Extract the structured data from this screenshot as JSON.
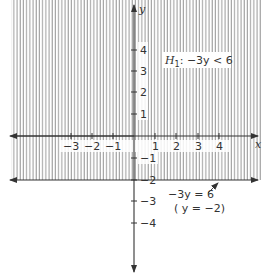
{
  "figure": {
    "region_label": "H₁: −3y < 6",
    "region_label_parts": {
      "H": "H",
      "sub": "1",
      "rest": ": −3y < 6"
    },
    "boundary_label_line1": "−3y = 6",
    "boundary_label_line2": "( y = −2)",
    "x_axis_label": "x",
    "y_axis_label": "y",
    "x_ticks": [
      "−3",
      "−2",
      "−1",
      "1",
      "2",
      "3",
      "4"
    ],
    "y_ticks_positive": [
      "4",
      "3",
      "2",
      "1"
    ],
    "y_ticks_negative": [
      "−1",
      "−2",
      "−3",
      "−4"
    ],
    "colors": {
      "ink": "#333333",
      "hatch": "#8a8a8a",
      "background": "#ffffff"
    }
  }
}
